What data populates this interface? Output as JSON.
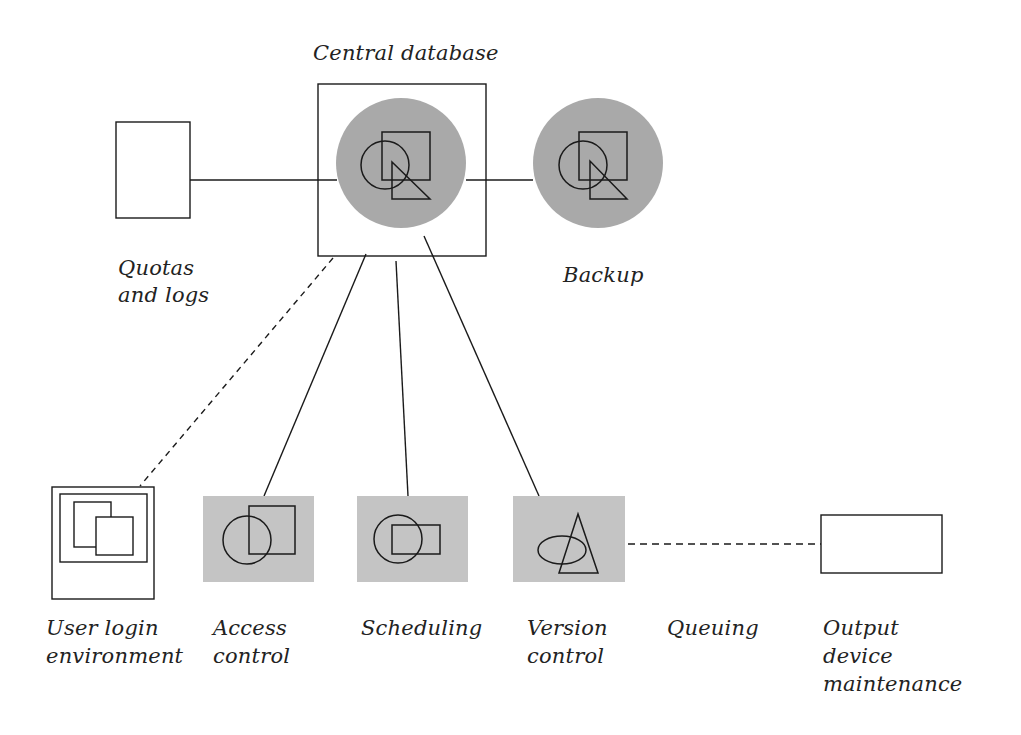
{
  "colors": {
    "fill_gray": "#a9a9a9",
    "fill_light_gray": "#c4c4c4",
    "stroke": "#1a1a1a",
    "background": "#ffffff"
  },
  "nodes": {
    "central_database": {
      "label": "Central database",
      "icon": "database-shapes-icon"
    },
    "backup": {
      "label": "Backup",
      "icon": "database-shapes-icon"
    },
    "quotas_logs": {
      "label_line1": "Quotas",
      "label_line2": "and logs"
    },
    "user_login": {
      "label_line1": "User login",
      "label_line2": "environment",
      "icon": "window-monitor-icon"
    },
    "access_control": {
      "label_line1": "Access",
      "label_line2": "control",
      "icon": "circle-square-icon"
    },
    "scheduling": {
      "label": "Scheduling",
      "icon": "circle-rect-icon"
    },
    "version_control": {
      "label_line1": "Version",
      "label_line2": "control",
      "icon": "ellipse-triangle-icon"
    },
    "queuing": {
      "label": "Queuing"
    },
    "output_device": {
      "label_line1": "Output",
      "label_line2": "device",
      "label_line3": "maintenance"
    }
  },
  "edges": [
    {
      "from": "quotas_logs",
      "to": "central_database",
      "style": "solid"
    },
    {
      "from": "central_database",
      "to": "backup",
      "style": "solid"
    },
    {
      "from": "central_database",
      "to": "access_control",
      "style": "solid"
    },
    {
      "from": "central_database",
      "to": "scheduling",
      "style": "solid"
    },
    {
      "from": "central_database",
      "to": "version_control",
      "style": "solid"
    },
    {
      "from": "central_database",
      "to": "user_login",
      "style": "dashed"
    },
    {
      "from": "version_control",
      "to": "output_device",
      "style": "dashed",
      "label": "Queuing"
    }
  ]
}
